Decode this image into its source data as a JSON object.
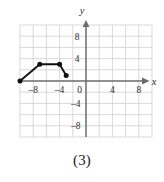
{
  "figure": {
    "caption": "(3)",
    "background_color": "#ffffff"
  },
  "axes": {
    "x_axis_label": "x",
    "y_axis_label": "y",
    "origin_label": "0",
    "x_tick_labels": [
      "–8",
      "–4",
      "0",
      "4",
      "8"
    ],
    "x_tick_values": [
      -8,
      -4,
      0,
      4,
      8
    ],
    "y_tick_labels": [
      "8",
      "4",
      "–4",
      "–8"
    ],
    "y_tick_values": [
      8,
      4,
      -4,
      -8
    ],
    "axis_color": "#6b6b6b",
    "grid_color": "#cfcfcf",
    "grid_spacing": 2,
    "grid_on": true
  },
  "chart_data": {
    "type": "line",
    "title": "(3)",
    "xlabel": "x",
    "ylabel": "y",
    "xlim": [
      -10,
      10
    ],
    "ylim": [
      -10,
      10
    ],
    "xticks": [
      -8,
      -4,
      0,
      4,
      8
    ],
    "yticks": [
      -8,
      -4,
      4,
      8
    ],
    "grid": true,
    "grid_spacing": 2,
    "legend": "none",
    "series": [
      {
        "name": "piecewise-segment",
        "marker": "filled-circle",
        "marker_color": "#111111",
        "line_color": "#111111",
        "x": [
          -10,
          -7,
          -4,
          -3
        ],
        "y": [
          0,
          3,
          3,
          1
        ],
        "points": [
          {
            "x": -10,
            "y": 0
          },
          {
            "x": -7,
            "y": 3
          },
          {
            "x": -4,
            "y": 3
          },
          {
            "x": -3,
            "y": 1
          }
        ]
      }
    ]
  }
}
